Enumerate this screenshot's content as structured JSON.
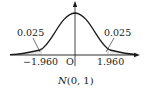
{
  "diagram": {
    "title": "N(0, 1)",
    "title_parts": {
      "italic": "N",
      "rest": "(0, 1)"
    },
    "distribution": "standard normal",
    "origin_label": "O",
    "left_tail": {
      "critical_value_label": "−1.960",
      "critical_value": -1.96,
      "area_label": "0.025",
      "area": 0.025
    },
    "right_tail": {
      "critical_value_label": "1.960",
      "critical_value": 1.96,
      "area_label": "0.025",
      "area": 0.025
    },
    "colors": {
      "line": "#1a1a1a",
      "text": "#222222",
      "background": "#ffffff"
    }
  }
}
